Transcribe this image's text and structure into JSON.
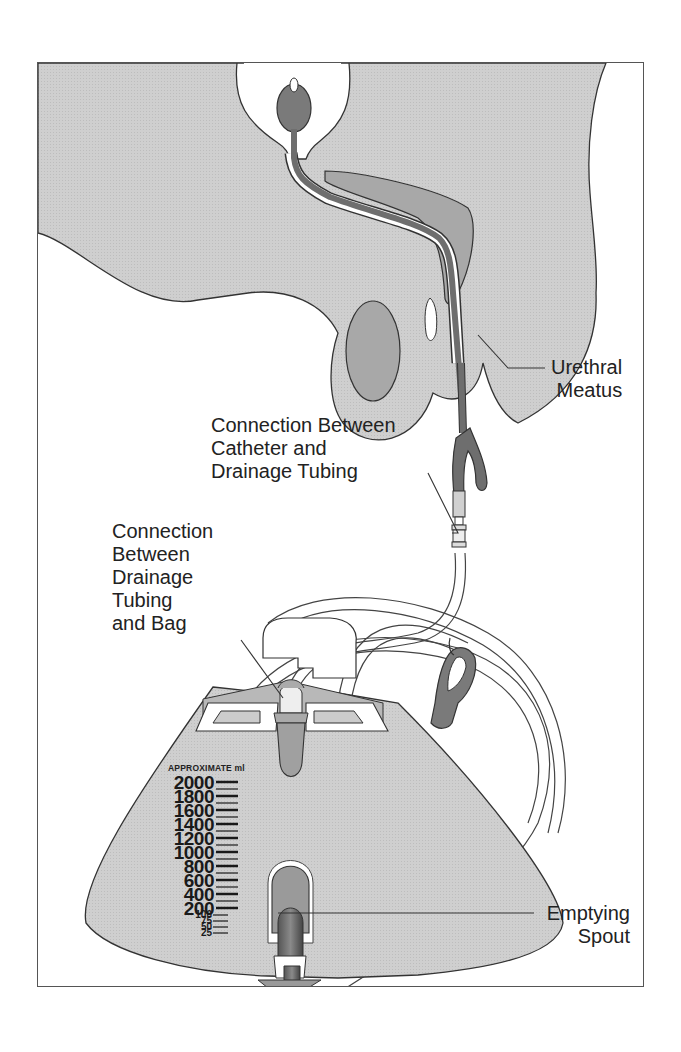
{
  "figure": {
    "colors": {
      "frame_border": "#555555",
      "body_fill": "#cfcfcf",
      "bag_fill": "#c6c6c6",
      "dark_organ": "#7a7a7a",
      "medium_organ": "#a8a8a8",
      "outline": "#333333",
      "background": "#ffffff"
    }
  },
  "labels": {
    "urethral_meatus": [
      "Urethral",
      "Meatus"
    ],
    "catheter_connection": [
      "Connection Between",
      "Catheter and",
      "Drainage Tubing"
    ],
    "bag_connection": [
      "Connection",
      "Between",
      "Drainage",
      "Tubing",
      "and Bag"
    ],
    "emptying_spout": [
      "Emptying",
      "Spout"
    ]
  },
  "bag_scale": {
    "heading": "APPROXIMATE ml",
    "major": [
      "2000",
      "1800",
      "1600",
      "1400",
      "1200",
      "1000",
      "800",
      "600",
      "400",
      "200"
    ],
    "minor": [
      "100",
      "75",
      "50",
      "25"
    ]
  }
}
